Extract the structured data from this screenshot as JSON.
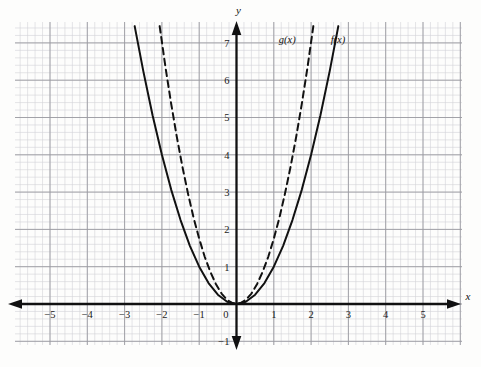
{
  "chart_data": {
    "type": "line",
    "title": "",
    "subtitle": "",
    "xlabel": "x",
    "ylabel": "y",
    "xlim": [
      -5.95,
      6.05
    ],
    "ylim": [
      -1.3,
      7.45
    ],
    "grid": true,
    "minor_grid": true,
    "grid_step": 1,
    "minor_grid_step": 0.2,
    "legend_position": "inline-annotation",
    "xticks": [
      -5,
      -4,
      -3,
      -2,
      -1,
      0,
      1,
      2,
      3,
      4,
      5
    ],
    "xtick_labels": [
      "−5",
      "−4",
      "−3",
      "−2",
      "−1",
      "0",
      "1",
      "2",
      "3",
      "4",
      "5"
    ],
    "yticks": [
      -1,
      1,
      2,
      3,
      4,
      5,
      6,
      7
    ],
    "ytick_labels": [
      "−1",
      "1",
      "2",
      "3",
      "4",
      "5",
      "6",
      "7"
    ],
    "series": [
      {
        "name": "f(x)",
        "label": "f(x)",
        "equation": "f(x) = x^2",
        "coefficient": 1,
        "style": "solid",
        "color": "#111111",
        "width": 2,
        "label_x": 2.72,
        "label_y": 7.0,
        "x": [
          -2.73,
          -2.5,
          -2.25,
          -2,
          -1.75,
          -1.5,
          -1.25,
          -1,
          -0.75,
          -0.5,
          -0.25,
          0,
          0.25,
          0.5,
          0.75,
          1,
          1.25,
          1.5,
          1.75,
          2,
          2.25,
          2.5,
          2.73
        ],
        "y": [
          7.45,
          6.25,
          5.06,
          4,
          3.06,
          2.25,
          1.56,
          1,
          0.56,
          0.25,
          0.06,
          0,
          0.06,
          0.25,
          0.56,
          1,
          1.56,
          2.25,
          3.06,
          4,
          5.06,
          6.25,
          7.45
        ]
      },
      {
        "name": "g(x)",
        "label": "g(x)",
        "equation": "g(x) = 1.75x^2",
        "coefficient": 1.75,
        "style": "dashed",
        "color": "#111111",
        "width": 2,
        "label_x": 1.36,
        "label_y": 7.0,
        "x": [
          -2.06,
          -1.9,
          -1.75,
          -1.6,
          -1.45,
          -1.3,
          -1.15,
          -1,
          -0.85,
          -0.7,
          -0.55,
          -0.4,
          -0.25,
          -0.1,
          0,
          0.1,
          0.25,
          0.4,
          0.55,
          0.7,
          0.85,
          1,
          1.15,
          1.3,
          1.45,
          1.6,
          1.75,
          1.9,
          2.06
        ],
        "y": [
          7.45,
          6.32,
          5.36,
          4.48,
          3.68,
          2.96,
          2.31,
          1.75,
          1.26,
          0.86,
          0.53,
          0.28,
          0.11,
          0.02,
          0,
          0.02,
          0.11,
          0.28,
          0.53,
          0.86,
          1.26,
          1.75,
          2.31,
          2.96,
          3.68,
          4.48,
          5.36,
          6.32,
          7.45
        ]
      }
    ],
    "annotations": [
      {
        "name": "g-curve-label",
        "text": "g(x)",
        "x": 1.36,
        "y": 7.0
      },
      {
        "name": "f-curve-label",
        "text": "f(x)",
        "x": 2.72,
        "y": 7.0
      }
    ],
    "axis_arrows": [
      "left",
      "right",
      "up",
      "down"
    ],
    "colors": {
      "axis": "#111111",
      "major_grid": "#9a9aa0",
      "minor_grid": "#d3d3d8",
      "curve": "#111111",
      "background": "#fdfdfc"
    }
  },
  "axes": {
    "x_name": "x",
    "y_name": "y"
  }
}
